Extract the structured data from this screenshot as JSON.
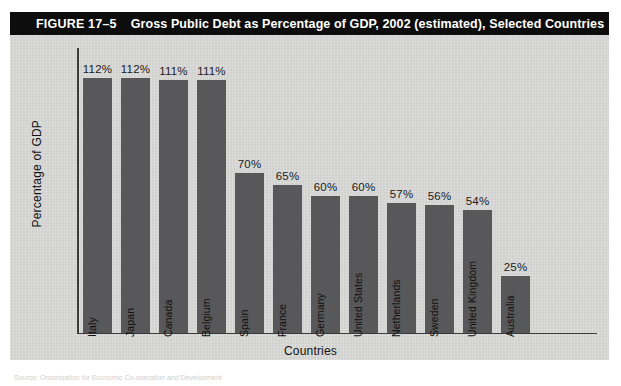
{
  "figure": {
    "number": "FIGURE 17–5",
    "title": "Gross Public Debt as Percentage of GDP, 2002 (estimated), Selected Countries",
    "source_note": "Source: Organisation for Economic Co-operation and Development"
  },
  "chart_data": {
    "type": "bar",
    "title": "Gross Public Debt as Percentage of GDP, 2002 (estimated), Selected Countries",
    "xlabel": "Countries",
    "ylabel": "Percentage of GDP",
    "ylim": [
      0,
      125
    ],
    "grid": false,
    "legend": "none",
    "value_suffix": "%",
    "bar_color": "#58585a",
    "categories": [
      "Italy",
      "Japan",
      "Canada",
      "Belgium",
      "Spain",
      "France",
      "Germany",
      "United States",
      "Netherlands",
      "Sweden",
      "United Kingdom",
      "Australia"
    ],
    "values": [
      112,
      112,
      111,
      111,
      70,
      65,
      60,
      60,
      57,
      56,
      54,
      25
    ],
    "labels": [
      "112%",
      "112%",
      "111%",
      "111%",
      "70%",
      "65%",
      "60%",
      "60%",
      "57%",
      "56%",
      "54%",
      "25%"
    ]
  }
}
